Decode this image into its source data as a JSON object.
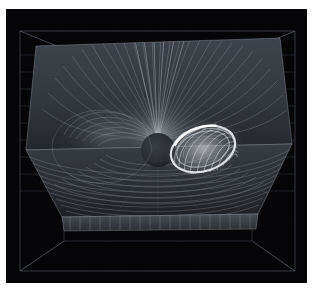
{
  "figure": {
    "kind": "scientific-volume-render",
    "caption": "",
    "background_color": "#ffffff",
    "scene_background_color": "#050508",
    "margin_px": {
      "left": 6,
      "top": 9,
      "right": 6,
      "bottom": 16
    },
    "scene_size_px": {
      "width": 301,
      "height": 274
    }
  },
  "colors": {
    "page": "#ffffff",
    "scene_background": "#050508",
    "box_wireframe": "#8d96a8",
    "box_wireframe_dim": "#4a5260",
    "grid_line": "#5c6472",
    "meridional_plane_base": "#3a3f47",
    "meridional_plane_dark": "#202328",
    "equatorial_plane_base": "#33373d",
    "equatorial_plane_dark": "#1b1d21",
    "streamline_bright": "#e8eaee",
    "streamline_mid": "#9aa0a8",
    "streamline_dim": "#555b64",
    "flux_rope_highlight": "#f2f4f7",
    "flux_rope_body": "#b9bfc7",
    "central_body": "#2b2e33",
    "lobe_glow": "#7d838c"
  },
  "scene": {
    "bounding_box": {
      "label": "simulation-domain-wireframe",
      "projection": "perspective",
      "visible_edges": 12,
      "front_face": {
        "top_left": [
          14,
          22
        ],
        "top_right": [
          289,
          22
        ],
        "bottom_left": [
          14,
          262
        ],
        "bottom_right": [
          289,
          262
        ]
      },
      "back_face": {
        "top_left": [
          58,
          40
        ],
        "top_right": [
          246,
          40
        ],
        "bottom_left": [
          58,
          232
        ],
        "bottom_right": [
          246,
          232
        ]
      }
    },
    "grid": {
      "visible": true,
      "orientation": "horizontal",
      "line_count": 9,
      "wall": "left-and-right-back-walls",
      "spacing_px": 17
    },
    "planes": [
      {
        "name": "meridional-plane",
        "role": "vertical cut plane",
        "orientation": "vertical",
        "field_pattern": "radial streamlines diverging from central body",
        "streamline_count": 46,
        "quad": [
          [
            30,
            37
          ],
          [
            274,
            29
          ],
          [
            286,
            135
          ],
          [
            20,
            141
          ]
        ]
      },
      {
        "name": "equatorial-plane",
        "role": "horizontal cut plane",
        "orientation": "horizontal",
        "field_pattern": "concentric arc streamlines circulating about central body",
        "streamline_count": 26,
        "quad": [
          [
            20,
            141
          ],
          [
            286,
            135
          ],
          [
            252,
            205
          ],
          [
            56,
            208
          ]
        ]
      },
      {
        "name": "front-apron-plane",
        "role": "thin front band below equatorial plane",
        "orientation": "vertical",
        "field_pattern": "vertical striations",
        "streamline_count": 34,
        "quad": [
          [
            56,
            208
          ],
          [
            252,
            205
          ],
          [
            250,
            220
          ],
          [
            58,
            222
          ]
        ]
      }
    ],
    "features": [
      {
        "name": "central-body",
        "description": "dark occulting sphere at domain center (planet / inner boundary)",
        "center_px": [
          152,
          141
        ],
        "radius_px": 17,
        "fill": "#2b2e33"
      },
      {
        "name": "flux-rope-torus",
        "description": "bright helical flux rope / twisted toroidal bundle on the dayside-right",
        "center_px": [
          197,
          140
        ],
        "radius_x_px": 34,
        "radius_y_px": 24,
        "tilt_deg": -18,
        "helix_turns": 22,
        "highlight": "#f2f4f7"
      },
      {
        "name": "left-lobe",
        "description": "broad swirling lobe of closed field lines on the nightside-left",
        "center_px": [
          100,
          133
        ],
        "radius_x_px": 52,
        "radius_y_px": 40
      },
      {
        "name": "cusp-fan",
        "description": "fan of near-vertical streamlines above the central body",
        "apex_px": [
          152,
          132
        ]
      }
    ]
  },
  "axes": {
    "shown": false,
    "tick_labels": [],
    "axis_titles": []
  },
  "legend": {
    "shown": false,
    "entries": []
  },
  "annotations": []
}
